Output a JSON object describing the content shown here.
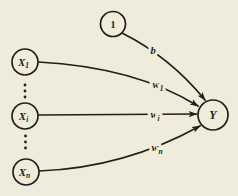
{
  "figure": {
    "name": "single-layer-network-diagram",
    "background_color": "#f0ecdc",
    "ink_color": "#241f16",
    "nodes": [
      {
        "id": "bias",
        "text": "1",
        "sub": "",
        "italic": false,
        "cx": 113,
        "cy": 24,
        "r": 12.5,
        "font_size": 10
      },
      {
        "id": "x1",
        "text": "X",
        "sub": "1",
        "italic": true,
        "cx": 25,
        "cy": 62,
        "r": 13,
        "font_size": 11
      },
      {
        "id": "xi",
        "text": "X",
        "sub": "i",
        "italic": true,
        "cx": 25,
        "cy": 116,
        "r": 13,
        "font_size": 11
      },
      {
        "id": "xn",
        "text": "X",
        "sub": "n",
        "italic": true,
        "cx": 26,
        "cy": 172,
        "r": 13,
        "font_size": 11
      },
      {
        "id": "y",
        "text": "Y",
        "sub": "",
        "italic": true,
        "cx": 213,
        "cy": 115,
        "r": 15,
        "font_size": 12
      }
    ],
    "edges": [
      {
        "id": "b",
        "text": "w",
        "label_text": "b",
        "sub": "",
        "d": "M 122 33 Q 170 57 205 100",
        "lx": 153,
        "ly": 54
      },
      {
        "id": "w1",
        "text": "w",
        "label_text": "w",
        "sub": "1",
        "d": "M 38 62 Q 135 67 198 106",
        "lx": 158,
        "ly": 88
      },
      {
        "id": "wi",
        "text": "w",
        "label_text": "w",
        "sub": "i",
        "d": "M 38 115 L 196.5 114",
        "lx": 155,
        "ly": 118
      },
      {
        "id": "wn",
        "text": "w",
        "label_text": "w",
        "sub": "n",
        "d": "M 39 171 Q 124 168 200 126",
        "lx": 157,
        "ly": 151
      }
    ],
    "ellipsis_dots": [
      {
        "x": 25,
        "y": 85
      },
      {
        "x": 25,
        "y": 91
      },
      {
        "x": 25,
        "y": 97
      },
      {
        "x": 25.5,
        "y": 136
      },
      {
        "x": 25.5,
        "y": 142
      },
      {
        "x": 25.5,
        "y": 148
      }
    ]
  }
}
